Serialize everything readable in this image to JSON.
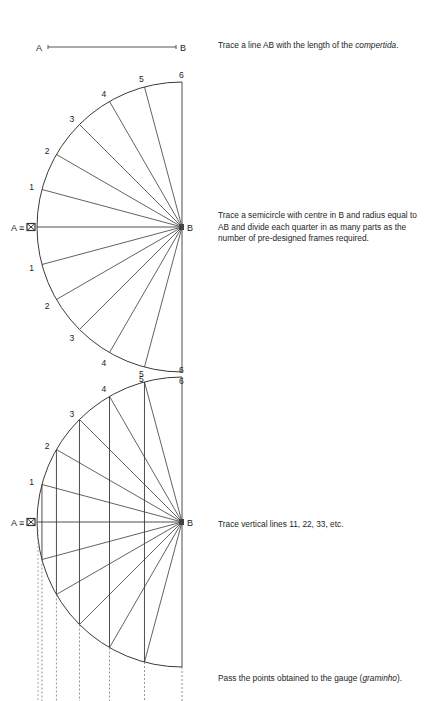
{
  "steps": [
    {
      "id": "step1",
      "caption_prefix": "Trace a line AB with the length of the ",
      "caption_italic": "compertida",
      "caption_suffix": ".",
      "labels": {
        "a": "A",
        "b": "B"
      }
    },
    {
      "id": "step2",
      "caption": "Trace a semicircle with centre in B and radius equal to AB and divide each quarter in as many parts as the number of pre-designed frames required.",
      "labels": {
        "a": "A ≡",
        "b": "B"
      },
      "division_labels_upper": [
        "1",
        "2",
        "3",
        "4",
        "5",
        "6"
      ],
      "division_labels_lower": [
        "1",
        "2",
        "3",
        "4",
        "5",
        "6"
      ]
    },
    {
      "id": "step3",
      "caption": "Trace vertical lines 11, 22, 33, etc.",
      "labels": {
        "a": "A ≡",
        "b": "B"
      },
      "division_labels_upper": [
        "1",
        "2",
        "3",
        "4",
        "5",
        "6"
      ]
    },
    {
      "id": "step4",
      "caption_prefix": "Pass the points obtained to the gauge (",
      "caption_italic": "graminho",
      "caption_suffix": ")."
    }
  ],
  "geometry": {
    "divisions_per_quarter": 6,
    "radius_px": 145,
    "line_color": "#3a3a3a"
  }
}
